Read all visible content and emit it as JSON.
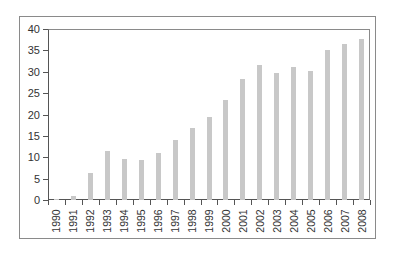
{
  "chart_data": {
    "type": "bar",
    "title": "",
    "xlabel": "",
    "ylabel": "",
    "ylim": [
      0,
      40
    ],
    "yticks": [
      "0",
      "5",
      "10",
      "15",
      "20",
      "25",
      "30",
      "35",
      "40"
    ],
    "grid": false,
    "legend": null,
    "categories": [
      "1990",
      "1991",
      "1992",
      "1993",
      "1994",
      "1995",
      "1996",
      "1997",
      "1998",
      "1999",
      "2000",
      "2001",
      "2002",
      "2003",
      "2004",
      "2005",
      "2006",
      "2007",
      "2008"
    ],
    "values": [
      0.2,
      1.0,
      6.3,
      11.5,
      9.5,
      9.3,
      11.0,
      14.0,
      16.8,
      19.4,
      23.3,
      28.2,
      31.6,
      29.8,
      31.1,
      30.2,
      35.0,
      36.4,
      37.7
    ],
    "bar_color": "#c8c8c8",
    "axis_color": "#555555",
    "frame_color": "#8a8a8a"
  }
}
